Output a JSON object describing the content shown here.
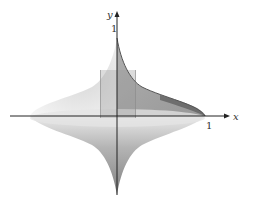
{
  "diagram": {
    "type": "solid-of-revolution",
    "axes": {
      "x_label": "x",
      "y_label": "y",
      "x_tick_label": "1",
      "y_tick_label": "1"
    },
    "colors": {
      "axis": "#222222",
      "surface_dark": "#8a8a8a",
      "surface_mid": "#b5b5b5",
      "surface_light": "#e6e6e6",
      "label": "#333333"
    }
  }
}
